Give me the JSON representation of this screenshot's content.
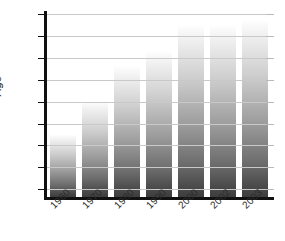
{
  "chart_data": {
    "type": "bar",
    "title": "",
    "xlabel": "",
    "ylabel": "Age",
    "categories": [
      "1960",
      "1970",
      "1980",
      "1990",
      "2000",
      "2002",
      "2003"
    ],
    "values": [
      69.0,
      72.0,
      75.2,
      76.5,
      78.9,
      78.9,
      79.4
    ],
    "ylim": [
      63.3,
      80.0
    ],
    "yticks": [
      64,
      66,
      68,
      70,
      72,
      74,
      76,
      78,
      80
    ],
    "ytick_labels": [
      "64",
      "66",
      "68",
      "70",
      "72",
      "74",
      "76",
      "78",
      "80"
    ],
    "grid": true,
    "legend": false,
    "bar_gradient_top": "#fdfdfd",
    "bar_gradient_bottom": "#3d3d3d",
    "axis_color": "#111111",
    "grid_color": "#c9c9c9",
    "background": "#ffffff"
  }
}
